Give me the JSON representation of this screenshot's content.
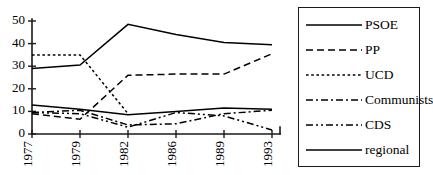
{
  "chart_data": {
    "type": "line",
    "title": "",
    "subtitle": "",
    "xlabel": "",
    "ylabel": "",
    "x": [
      "1977",
      "1979",
      "1982",
      "1986",
      "1989",
      "1993"
    ],
    "categories": [
      "1977",
      "1979",
      "1982",
      "1986",
      "1989",
      "1993"
    ],
    "xtick_labels": [
      "1977",
      "1979",
      "1982",
      "1986",
      "1989",
      "1993"
    ],
    "xtick_rotation": -90,
    "ytick_labels": [
      "0",
      "10",
      "20",
      "30",
      "40",
      "50"
    ],
    "yticks": [
      0,
      10,
      20,
      30,
      40,
      50
    ],
    "ylim": [
      0,
      50
    ],
    "grid": false,
    "legend_position": "right-outside",
    "legend_boxed": true,
    "series": [
      {
        "name": "PSOE",
        "style": "solid",
        "dash": "none",
        "values": [
          29,
          30.5,
          48.5,
          44,
          40.5,
          39.5
        ]
      },
      {
        "name": "PP",
        "style": "dashed",
        "dash": "7 4",
        "values": [
          9,
          6.5,
          26,
          26.5,
          26.5,
          35.5
        ]
      },
      {
        "name": "UCD",
        "style": "dotted",
        "dash": "2.6 2.6",
        "values": [
          35,
          35,
          9,
          null,
          null,
          null
        ]
      },
      {
        "name": "Communists",
        "style": "dash-dot",
        "dash": "7 3 2 3",
        "values": [
          9.5,
          10.5,
          4,
          4.5,
          9,
          10.5
        ]
      },
      {
        "name": "CDS",
        "style": "dash-dot-dot",
        "dash": "7 3 2 3 2 3",
        "values": [
          9.5,
          9,
          3,
          9.5,
          8,
          1.8
        ]
      },
      {
        "name": "regional",
        "style": "solid",
        "dash": "none",
        "values": [
          12.8,
          11,
          8.5,
          10,
          11.5,
          11
        ]
      }
    ]
  },
  "legend": {
    "items": [
      {
        "label": "PSOE",
        "swatch": "legend-swatch-solid"
      },
      {
        "label": "PP",
        "swatch": "legend-swatch-dashed"
      },
      {
        "label": "UCD",
        "swatch": "legend-swatch-dotted"
      },
      {
        "label": "Communists",
        "swatch": "legend-swatch-dashdot"
      },
      {
        "label": "CDS",
        "swatch": "legend-swatch-dashdotdot"
      },
      {
        "label": "regional",
        "swatch": "legend-swatch-solid"
      }
    ]
  },
  "colors": {
    "axis": "#1a1a1a",
    "series": "#000000",
    "background": "#ffffff"
  }
}
